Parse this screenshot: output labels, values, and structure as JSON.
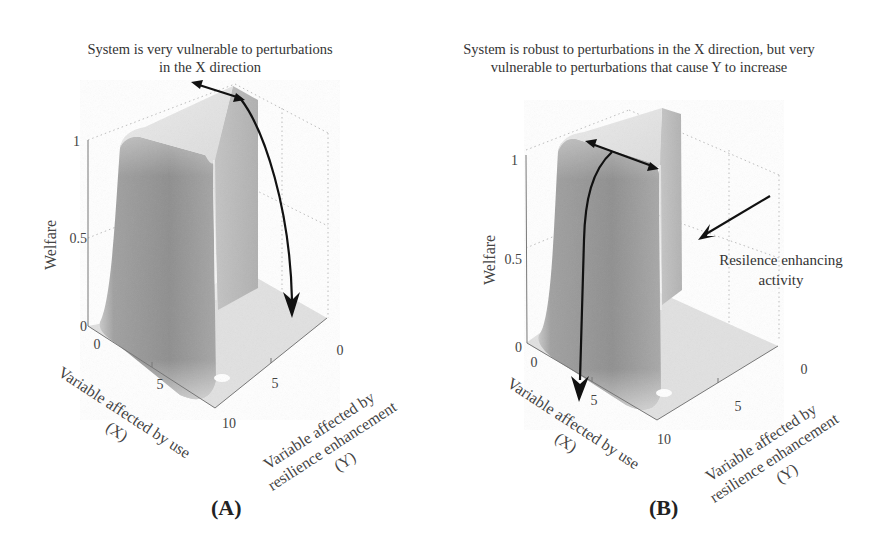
{
  "figure": {
    "panels": [
      {
        "id": "A",
        "label": "(A)",
        "title": "System is very vulnerable to perturbations\nin the X direction",
        "z_axis": {
          "label": "Welfare",
          "ticks": [
            "0",
            "0.5",
            "1"
          ]
        },
        "x_axis": {
          "label_line1": "Variable affected by use",
          "label_line2": "(X)",
          "ticks": [
            "0",
            "5",
            "10"
          ]
        },
        "y_axis": {
          "label_line1": "Variable affected by",
          "label_line2": "resilience enhancement",
          "label_line3": "(Y)",
          "ticks": [
            "0",
            "5",
            "10"
          ]
        },
        "arrows": [
          "double-headed arrow along ridge top (X direction)",
          "curved arrow from ridge top down to floor"
        ]
      },
      {
        "id": "B",
        "label": "(B)",
        "title": "System is robust to perturbations in the X direction, but very\nvulnerable to perturbations that cause Y to increase",
        "z_axis": {
          "label": "Welfare",
          "ticks": [
            "0",
            "0.5",
            "1"
          ]
        },
        "x_axis": {
          "label_line1": "Variable affected by use",
          "label_line2": "(X)",
          "ticks": [
            "0",
            "5",
            "10"
          ]
        },
        "y_axis": {
          "label_line1": "Variable affected by",
          "label_line2": "resilience enhancement",
          "label_line3": "(Y)",
          "ticks": [
            "0",
            "5",
            "10"
          ]
        },
        "annotation": "Resilence enhancing\nactivity",
        "arrows": [
          "double-headed arrow across wider plateau top",
          "curved arrow from plateau down front face to floor",
          "arrow pointing to plateau side (resilience enhancing activity)"
        ]
      }
    ],
    "colors": {
      "surface_light": "#e6e6e6",
      "surface_mid": "#a9a9a9",
      "surface_dark": "#8c8c8c",
      "floor": "#e2e2e2",
      "arrow": "#111111",
      "text": "#3a3a3a"
    }
  }
}
